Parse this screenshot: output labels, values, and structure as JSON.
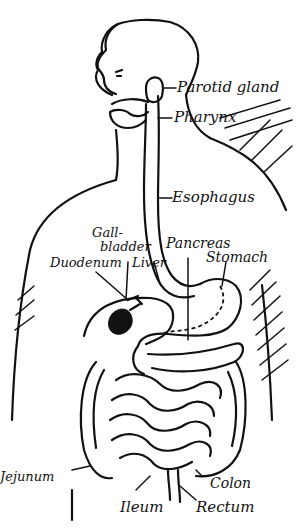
{
  "diagram": {
    "labels": {
      "parotid_gland": "Parotid gland",
      "pharynx": "Pharynx",
      "esophagus": "Esophagus",
      "gall_bladder_line1": "Gall-",
      "gall_bladder_line2": "bladder",
      "pancreas": "Pancreas",
      "duodenum": "Duodenum",
      "liver": "Liver",
      "stomach": "Stomach",
      "jejunum": "Jejunum",
      "colon": "Colon",
      "ileum": "Ileum",
      "rectum": "Rectum"
    },
    "colors": {
      "ink": "#111111",
      "background": "#ffffff"
    }
  }
}
